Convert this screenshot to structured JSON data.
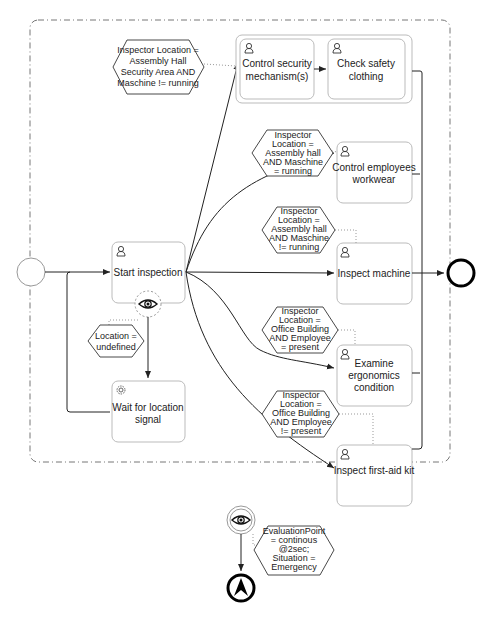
{
  "diagram": {
    "type": "BPMN process",
    "colors": {
      "stroke": "#333333",
      "box": "#bbbbbb",
      "dashed": "#888888",
      "end": "#000000"
    },
    "tasks": [
      {
        "id": "start_inspection",
        "label": [
          "Start inspection"
        ],
        "icon": "user-icon"
      },
      {
        "id": "control_security",
        "label": [
          "Control security",
          "mechanism(s)"
        ],
        "icon": "user-icon"
      },
      {
        "id": "check_safety",
        "label": [
          "Check safety",
          "clothing"
        ],
        "icon": "user-icon"
      },
      {
        "id": "control_workwear",
        "label": [
          "Control employees",
          "workwear"
        ],
        "icon": "user-icon"
      },
      {
        "id": "inspect_machine",
        "label": [
          "Inspect machine"
        ],
        "icon": "user-icon"
      },
      {
        "id": "examine_ergonomics",
        "label": [
          "Examine",
          "ergonomics",
          "condition"
        ],
        "icon": "user-icon"
      },
      {
        "id": "inspect_firstaid",
        "label": [
          "Inspect first-aid kit"
        ],
        "icon": "user-icon"
      },
      {
        "id": "wait_location",
        "label": [
          "Wait for location",
          "signal"
        ],
        "icon": "gear-icon"
      }
    ],
    "conditions": [
      {
        "id": "c_security",
        "lines": [
          "Inspector Location =",
          "Assembly Hall",
          "Security Area AND",
          "Maschine != running"
        ]
      },
      {
        "id": "c_workwear",
        "lines": [
          "Inspector",
          "Location =",
          "Assembly hall",
          "AND Maschine",
          "= running"
        ]
      },
      {
        "id": "c_machine",
        "lines": [
          "Inspector",
          "Location =",
          "Assembly hall",
          "AND Maschine",
          "!= running"
        ]
      },
      {
        "id": "c_ergonomics",
        "lines": [
          "Inspector",
          "Location =",
          "Office Building",
          "AND Employee",
          "= present"
        ]
      },
      {
        "id": "c_firstaid",
        "lines": [
          "Inspector",
          "Location =",
          "Office Building",
          "AND Employee",
          "!= present"
        ]
      },
      {
        "id": "c_undefined",
        "lines": [
          "Location =",
          "undefined"
        ]
      },
      {
        "id": "c_emergency",
        "lines": [
          "EvaluationPoint",
          "= continous",
          "@2sec;",
          "Situation =",
          "Emergency"
        ]
      }
    ],
    "events": {
      "start": "start-event",
      "end": "end-event",
      "escalation": "escalation-end-event",
      "context_monitor_task": "eye-icon",
      "context_monitor_boundary": "eye-icon"
    }
  }
}
